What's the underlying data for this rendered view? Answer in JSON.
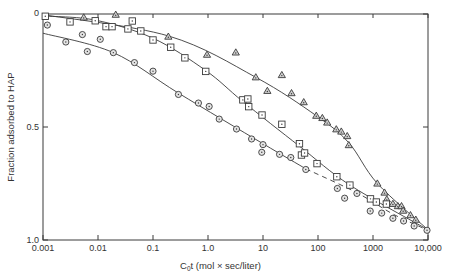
{
  "chart_data": {
    "type": "scatter",
    "title": "",
    "xlabel": "C0t (mol × sec/liter)",
    "xlabel_main": "C",
    "xlabel_sub": "0",
    "xlabel_rest": "t (mol × sec/liter)",
    "ylabel": "Fraction adsorbed to HAP",
    "xscale": "log",
    "xlim": [
      0.001,
      10000
    ],
    "ylim": [
      0,
      1.0
    ],
    "y_inverted": true,
    "x_ticks": [
      0.001,
      0.01,
      0.1,
      1.0,
      10,
      100,
      1000,
      10000
    ],
    "x_tick_labels": [
      "0.001",
      "0.01",
      "0.1",
      "1.0",
      "10",
      "100",
      "1000",
      "10,000"
    ],
    "y_ticks": [
      0,
      0.5,
      1.0
    ],
    "y_tick_labels": [
      "0",
      "0.5",
      "1.0"
    ],
    "grid": false,
    "legend": null,
    "series": [
      {
        "name": "triangles",
        "marker": "triangle",
        "points": [
          [
            0.0055,
            0.015
          ],
          [
            0.021,
            0.003
          ],
          [
            0.19,
            0.1
          ],
          [
            0.96,
            0.18
          ],
          [
            3.2,
            0.17
          ],
          [
            7.4,
            0.28
          ],
          [
            22,
            0.27
          ],
          [
            12,
            0.34
          ],
          [
            33,
            0.35
          ],
          [
            55,
            0.39
          ],
          [
            93,
            0.45
          ],
          [
            120,
            0.46
          ],
          [
            147,
            0.48
          ],
          [
            215,
            0.51
          ],
          [
            265,
            0.52
          ],
          [
            340,
            0.54
          ],
          [
            363,
            0.58
          ],
          [
            1200,
            0.75
          ],
          [
            1620,
            0.79
          ],
          [
            1780,
            0.82
          ],
          [
            2300,
            0.84
          ],
          [
            2830,
            0.85
          ],
          [
            3300,
            0.85
          ],
          [
            3530,
            0.87
          ],
          [
            4800,
            0.89
          ],
          [
            6000,
            0.91
          ]
        ],
        "fit": [
          [
            0.001,
            0.003
          ],
          [
            0.19,
            0.097
          ],
          [
            7.4,
            0.28
          ],
          [
            93,
            0.45
          ],
          [
            363,
            0.57
          ],
          [
            1200,
            0.75
          ],
          [
            10000,
            0.955
          ]
        ],
        "fit_style": "solid"
      },
      {
        "name": "squares",
        "marker": "square",
        "points": [
          [
            0.0011,
            0.01
          ],
          [
            0.0031,
            0.035
          ],
          [
            0.0089,
            0.03
          ],
          [
            0.014,
            0.056
          ],
          [
            0.018,
            0.056
          ],
          [
            0.035,
            0.066
          ],
          [
            0.042,
            0.031
          ],
          [
            0.06,
            0.075
          ],
          [
            0.1,
            0.115
          ],
          [
            0.21,
            0.147
          ],
          [
            0.38,
            0.194
          ],
          [
            0.91,
            0.254
          ],
          [
            4.3,
            0.38
          ],
          [
            5.3,
            0.376
          ],
          [
            5.5,
            0.41
          ],
          [
            9.6,
            0.447
          ],
          [
            22,
            0.488
          ],
          [
            46,
            0.574
          ],
          [
            50,
            0.624
          ],
          [
            57,
            0.615
          ],
          [
            96,
            0.662
          ],
          [
            220,
            0.72
          ],
          [
            380,
            0.757
          ],
          [
            900,
            0.818
          ],
          [
            1150,
            0.832
          ],
          [
            1750,
            0.841
          ]
        ],
        "fit": [
          [
            0.001,
            0.009
          ],
          [
            0.0089,
            0.027
          ],
          [
            0.1,
            0.107
          ],
          [
            0.91,
            0.25
          ],
          [
            4.3,
            0.387
          ],
          [
            46,
            0.585
          ],
          [
            380,
            0.757
          ],
          [
            10000,
            0.955
          ]
        ],
        "fit_style": "solid"
      },
      {
        "name": "circles",
        "marker": "circle",
        "points": [
          [
            0.0012,
            0.049
          ],
          [
            0.0026,
            0.124
          ],
          [
            0.0052,
            0.091
          ],
          [
            0.0064,
            0.166
          ],
          [
            0.011,
            0.112
          ],
          [
            0.019,
            0.171
          ],
          [
            0.046,
            0.215
          ],
          [
            0.1,
            0.253
          ],
          [
            0.29,
            0.356
          ],
          [
            0.67,
            0.394
          ],
          [
            1.05,
            0.409
          ],
          [
            1.6,
            0.465
          ],
          [
            3.3,
            0.509
          ],
          [
            6.2,
            0.553
          ],
          [
            10,
            0.578
          ],
          [
            9.5,
            0.612
          ],
          [
            20,
            0.621
          ],
          [
            32,
            0.635
          ],
          [
            60,
            0.688
          ],
          [
            225,
            0.772
          ],
          [
            305,
            0.815
          ],
          [
            510,
            0.794
          ],
          [
            890,
            0.872
          ],
          [
            1440,
            0.881
          ],
          [
            2300,
            0.904
          ],
          [
            3600,
            0.916
          ],
          [
            5600,
            0.938
          ],
          [
            9600,
            0.957
          ]
        ],
        "fit": [
          [
            0.001,
            0.085
          ],
          [
            0.019,
            0.171
          ],
          [
            0.29,
            0.35
          ],
          [
            10,
            0.574
          ],
          [
            60,
            0.685
          ]
        ],
        "fit_style": "solid",
        "fit_dashed": [
          [
            60,
            0.685
          ],
          [
            500,
            0.79
          ],
          [
            2300,
            0.885
          ],
          [
            10000,
            0.957
          ]
        ]
      }
    ]
  }
}
